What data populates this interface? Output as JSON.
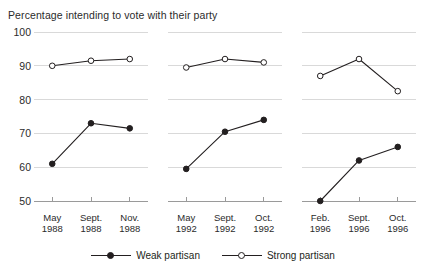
{
  "chart_data": {
    "type": "line",
    "title": "Percentage intending to vote with their party",
    "xlabel": "",
    "ylabel": "",
    "ylim": [
      50,
      100
    ],
    "yticks": [
      50,
      60,
      70,
      80,
      90,
      100
    ],
    "ytick_labels": [
      "50",
      "60",
      "70",
      "80",
      "90",
      "100"
    ],
    "grid": true,
    "legend_position": "bottom-center",
    "panels": [
      {
        "name": "1988",
        "categories": [
          "May 1988",
          "Sept. 1988",
          "Nov. 1988"
        ],
        "tick_lines": [
          [
            "May",
            "1988"
          ],
          [
            "Sept.",
            "1988"
          ],
          [
            "Nov.",
            "1988"
          ]
        ],
        "series": [
          {
            "name": "Weak partisan",
            "values": [
              61,
              73,
              71.5
            ]
          },
          {
            "name": "Strong partisan",
            "values": [
              90,
              91.5,
              92
            ]
          }
        ]
      },
      {
        "name": "1992",
        "categories": [
          "May 1992",
          "Sept. 1992",
          "Oct. 1992"
        ],
        "tick_lines": [
          [
            "May",
            "1992"
          ],
          [
            "Sept.",
            "1992"
          ],
          [
            "Oct.",
            "1992"
          ]
        ],
        "series": [
          {
            "name": "Weak partisan",
            "values": [
              59.5,
              70.5,
              74
            ]
          },
          {
            "name": "Strong partisan",
            "values": [
              89.5,
              92,
              91
            ]
          }
        ]
      },
      {
        "name": "1996",
        "categories": [
          "Feb. 1996",
          "Sept. 1996",
          "Oct. 1996"
        ],
        "tick_lines": [
          [
            "Feb.",
            "1996"
          ],
          [
            "Sept.",
            "1996"
          ],
          [
            "Oct.",
            "1996"
          ]
        ],
        "series": [
          {
            "name": "Weak partisan",
            "values": [
              50,
              62,
              66
            ]
          },
          {
            "name": "Strong partisan",
            "values": [
              87,
              92,
              82.5
            ]
          }
        ]
      }
    ],
    "legend": [
      {
        "label": "Weak partisan",
        "marker": "filled-circle",
        "color": "#231f20"
      },
      {
        "label": "Strong partisan",
        "marker": "open-circle",
        "color": "#231f20"
      }
    ],
    "colors": {
      "line": "#231f20",
      "grid": "#d9d9d9",
      "axis": "#9a9a9a",
      "text": "#231f20",
      "background": "#ffffff"
    }
  }
}
